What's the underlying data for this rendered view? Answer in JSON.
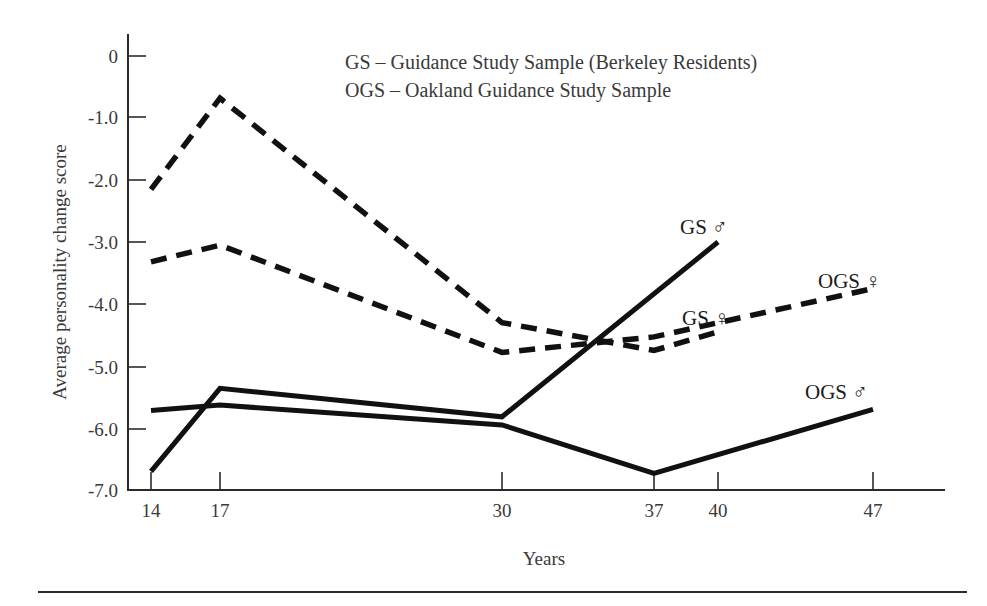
{
  "figure": {
    "background_color": "#ffffff",
    "line_color": "#111111",
    "axis_color": "#2b2b2b"
  },
  "axes": {
    "y_title": "Average personality change score",
    "x_title": "Years",
    "y_ticks": [
      "0",
      "-1.0",
      "-2.0",
      "-3.0",
      "-4.0",
      "-5.0",
      "-6.0",
      "-7.0"
    ],
    "x_ticks": [
      "14",
      "17",
      "30",
      "37",
      "40",
      "47"
    ]
  },
  "legend": {
    "line1": "GS – Guidance Study Sample (Berkeley Residents)",
    "line2": "OGS – Oakland Guidance Study Sample"
  },
  "series_labels": {
    "gs_male": "GS ♂",
    "gs_female": "GS ♀",
    "ogs_female": "OGS ♀",
    "ogs_male": "OGS ♂"
  },
  "chart_data": {
    "type": "line",
    "title": "",
    "xlabel": "Years",
    "ylabel": "Average personality change score",
    "xlim": [
      14,
      47
    ],
    "ylim": [
      -7.0,
      0.0
    ],
    "grid": false,
    "legend_position": "inline-annotations",
    "x_ticks": [
      14,
      17,
      30,
      37,
      40,
      47
    ],
    "y_ticks": [
      0,
      -1.0,
      -2.0,
      -3.0,
      -4.0,
      -5.0,
      -6.0,
      -7.0
    ],
    "annotations": [
      "GS – Guidance Study Sample (Berkeley Residents)",
      "OGS – Oakland Guidance Study Sample"
    ],
    "series": [
      {
        "name": "GS ♀",
        "style": "dashed",
        "x": [
          14,
          17,
          30,
          37,
          40
        ],
        "values": [
          -2.15,
          -0.68,
          -4.3,
          -4.75,
          -4.45
        ]
      },
      {
        "name": "OGS ♀",
        "style": "dashed",
        "x": [
          14,
          17,
          30,
          37,
          47
        ],
        "values": [
          -3.32,
          -3.05,
          -4.78,
          -4.53,
          -3.75
        ]
      },
      {
        "name": "GS ♂",
        "style": "solid",
        "x": [
          14,
          17,
          30,
          40
        ],
        "values": [
          -6.7,
          -5.36,
          -5.82,
          -3.0
        ]
      },
      {
        "name": "OGS ♂",
        "style": "solid",
        "x": [
          14,
          17,
          30,
          37,
          47
        ],
        "values": [
          -5.72,
          -5.63,
          -5.95,
          -6.73,
          -5.7
        ]
      }
    ]
  }
}
